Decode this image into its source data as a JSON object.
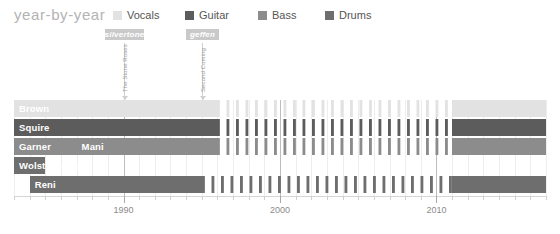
{
  "header": {
    "title": "year-by-year"
  },
  "legend": {
    "position": "top-right",
    "items": [
      {
        "label": "Vocals",
        "color": "#e2e2e2",
        "x": 0
      },
      {
        "label": "Guitar",
        "color": "#5c5c5c",
        "x": 72
      },
      {
        "label": "Bass",
        "color": "#8c8c8c",
        "x": 145
      },
      {
        "label": "Drums",
        "color": "#6e6e6e",
        "x": 212
      }
    ]
  },
  "annotations": {
    "badges": [
      {
        "id": "silvertone",
        "label": "silvertone",
        "x": 105,
        "width": 39,
        "y": 29,
        "color": "#c9c9c9",
        "line_x": 124,
        "caption": "The Stone Roses",
        "caption_x": 122,
        "caption_y": 92
      },
      {
        "id": "geffen",
        "label": "geffen",
        "x": 186,
        "width": 33,
        "y": 29,
        "color": "#c9c9c9",
        "line_x": 202,
        "caption": "Second Coming",
        "caption_x": 200,
        "caption_y": 92
      }
    ]
  },
  "chart_data": {
    "type": "bar",
    "orientation": "horizontal-timeline",
    "title": "year-by-year",
    "xlabel": "",
    "ylabel": "",
    "xlim": [
      1983,
      2017
    ],
    "tick_labels": [
      "1990",
      "2000",
      "2010"
    ],
    "tick_years": [
      1990,
      2000,
      2010
    ],
    "grid": true,
    "legend_position": "top-right",
    "hiatus_start": 1996,
    "hiatus_end": 2011,
    "categories": [
      "Brown",
      "Squire",
      "Garner",
      "Mani",
      "Wolstencroft",
      "Reni"
    ],
    "rows": [
      {
        "name": "Brown",
        "label": "Brown",
        "role": "Vocals",
        "color": "#e2e2e2",
        "label_color": "#ffffff",
        "segments": [
          {
            "start": 1983,
            "end": 1996,
            "style": "solid"
          },
          {
            "start": 1996,
            "end": 2011,
            "style": "striped"
          },
          {
            "start": 2011,
            "end": 2017,
            "style": "solid"
          }
        ]
      },
      {
        "name": "Squire",
        "label": "Squire",
        "role": "Guitar",
        "color": "#5c5c5c",
        "label_color": "#ffffff",
        "segments": [
          {
            "start": 1983,
            "end": 1996,
            "style": "solid"
          },
          {
            "start": 1996,
            "end": 2011,
            "style": "striped"
          },
          {
            "start": 2011,
            "end": 2017,
            "style": "solid"
          }
        ]
      },
      {
        "name": "Garner",
        "label": "Garner",
        "role": "Bass",
        "color": "#8c8c8c",
        "label_color": "#ffffff",
        "segments": [
          {
            "start": 1983,
            "end": 1987,
            "style": "solid"
          }
        ]
      },
      {
        "name": "Mani",
        "label": "Mani",
        "role": "Bass",
        "color": "#8c8c8c",
        "label_color": "#ffffff",
        "row_index": 2,
        "segments": [
          {
            "start": 1987,
            "end": 1996,
            "style": "solid"
          },
          {
            "start": 1996,
            "end": 2011,
            "style": "striped"
          },
          {
            "start": 2011,
            "end": 2017,
            "style": "solid"
          }
        ]
      },
      {
        "name": "Wolstencroft",
        "label": "Wolstencroft",
        "role": "Drums",
        "color": "#6e6e6e",
        "label_color": "#ffffff",
        "segments": [
          {
            "start": 1983,
            "end": 1985,
            "style": "solid"
          }
        ]
      },
      {
        "name": "Reni",
        "label": "Reni",
        "role": "Drums",
        "color": "#6e6e6e",
        "label_color": "#ffffff",
        "segments": [
          {
            "start": 1984,
            "end": 1995,
            "style": "solid"
          },
          {
            "start": 1995,
            "end": 2011,
            "style": "striped"
          },
          {
            "start": 2011,
            "end": 2017,
            "style": "solid"
          }
        ]
      }
    ]
  }
}
